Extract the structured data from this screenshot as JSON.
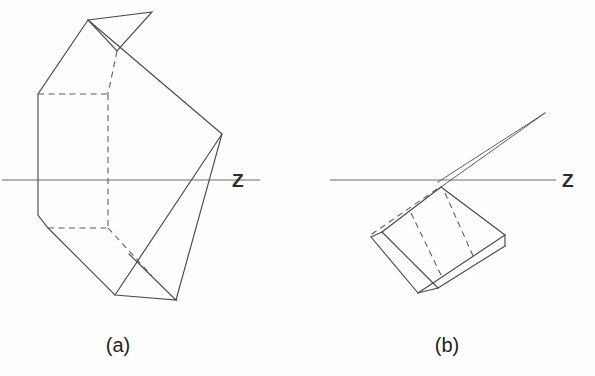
{
  "figure": {
    "background_color": "#fefefe",
    "line_color": "#4a4a4a",
    "hidden_line_color": "#5a5a5a",
    "axis_color": "#6a6a6a",
    "text_color": "#1f1f1f",
    "width": 595,
    "height": 376
  },
  "panels": [
    {
      "id": "a",
      "caption": "(a)",
      "caption_x": 118,
      "caption_y": 352,
      "axis": {
        "label": "Z",
        "label_x": 232,
        "label_y": 187,
        "y": 180,
        "x_start": 2,
        "x_end": 222
      },
      "solid_paths": [
        "M 88 20 L 152 12 L 117 51",
        "M 88 20 L 38 94 L 38 215 L 48 228 L 115 295 L 176 300 L 129 254",
        "M 88 20 L 222 134 L 176 300",
        "M 115 295 L 222 134",
        "M 117 51 L 108 94"
      ],
      "hidden_paths": [
        "M 38 94 L 108 94",
        "M 108 94 L 108 228",
        "M 48 228 L 108 228",
        "M 108 228 L 152 276",
        "M 117 51 L 108 94"
      ]
    },
    {
      "id": "b",
      "caption": "(b)",
      "caption_x": 447,
      "caption_y": 352,
      "axis": {
        "label": "Z",
        "label_x": 562,
        "label_y": 187,
        "y": 180,
        "x_start": 330,
        "x_end": 556
      },
      "spike_paths": [
        "M 438 182 L 545 113 L 441 186",
        "M 438 182 L 545 113"
      ],
      "plate_paths": [
        "M 441 186 L 505 235 L 478 262 L 418 293 L 371 237 L 382 232",
        "M 441 186 L 382 232",
        "M 418 293 L 478 262",
        "M 371 237 L 418 293",
        "M 382 232 L 438 288",
        "M 438 288 L 418 293",
        "M 438 288 L 505 246",
        "M 505 235 L 505 246"
      ],
      "plate_hidden_paths": [
        "M 437 187 L 380 230",
        "M 380 230 L 369 236",
        "M 443 191 L 472 256",
        "M 411 210 L 441 272"
      ]
    }
  ]
}
